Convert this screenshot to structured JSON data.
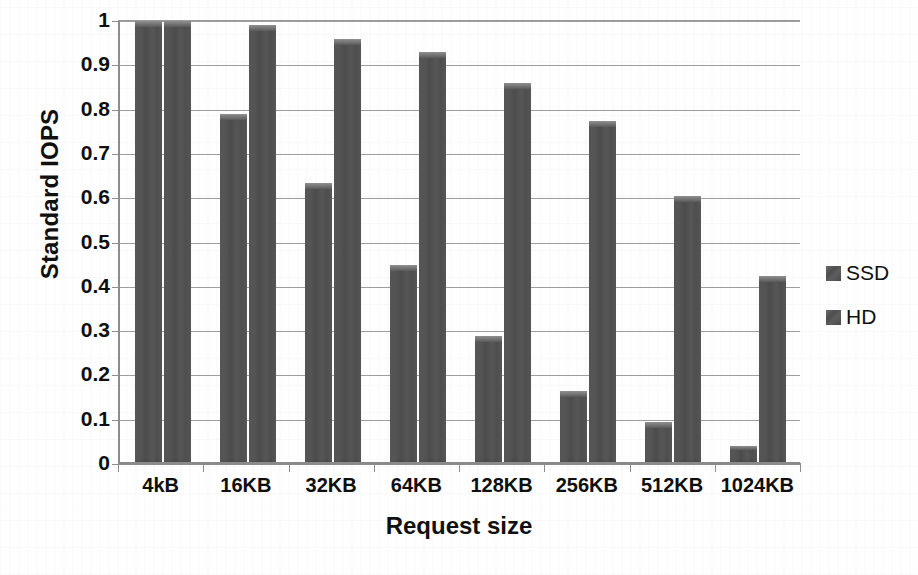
{
  "chart_data": {
    "type": "bar",
    "title": "",
    "xlabel": "Request size",
    "ylabel": "Standard IOPS",
    "categories": [
      "4kB",
      "16KB",
      "32KB",
      "64KB",
      "128KB",
      "256KB",
      "512KB",
      "1024KB"
    ],
    "series": [
      {
        "name": "SSD",
        "values": [
          1.0,
          0.79,
          0.635,
          0.45,
          0.29,
          0.165,
          0.095,
          0.04
        ],
        "color": "#535353"
      },
      {
        "name": "HD",
        "values": [
          1.0,
          0.99,
          0.96,
          0.93,
          0.86,
          0.775,
          0.605,
          0.425
        ],
        "color": "#535353"
      }
    ],
    "ylim": [
      0,
      1
    ],
    "ytick_values": [
      0,
      0.1,
      0.2,
      0.3,
      0.4,
      0.5,
      0.6,
      0.7,
      0.8,
      0.9,
      1
    ],
    "ytick_labels": [
      "0",
      "0.1",
      "0.2",
      "0.3",
      "0.4",
      "0.5",
      "0.6",
      "0.7",
      "0.8",
      "0.9",
      "1"
    ],
    "grid": true,
    "grid_axis": "y",
    "legend_position": "right",
    "legend_entries": [
      "SSD",
      "HD"
    ],
    "background_color": "#ffffff",
    "axis_color": "#8d8d8d",
    "text_color": "#101010"
  }
}
